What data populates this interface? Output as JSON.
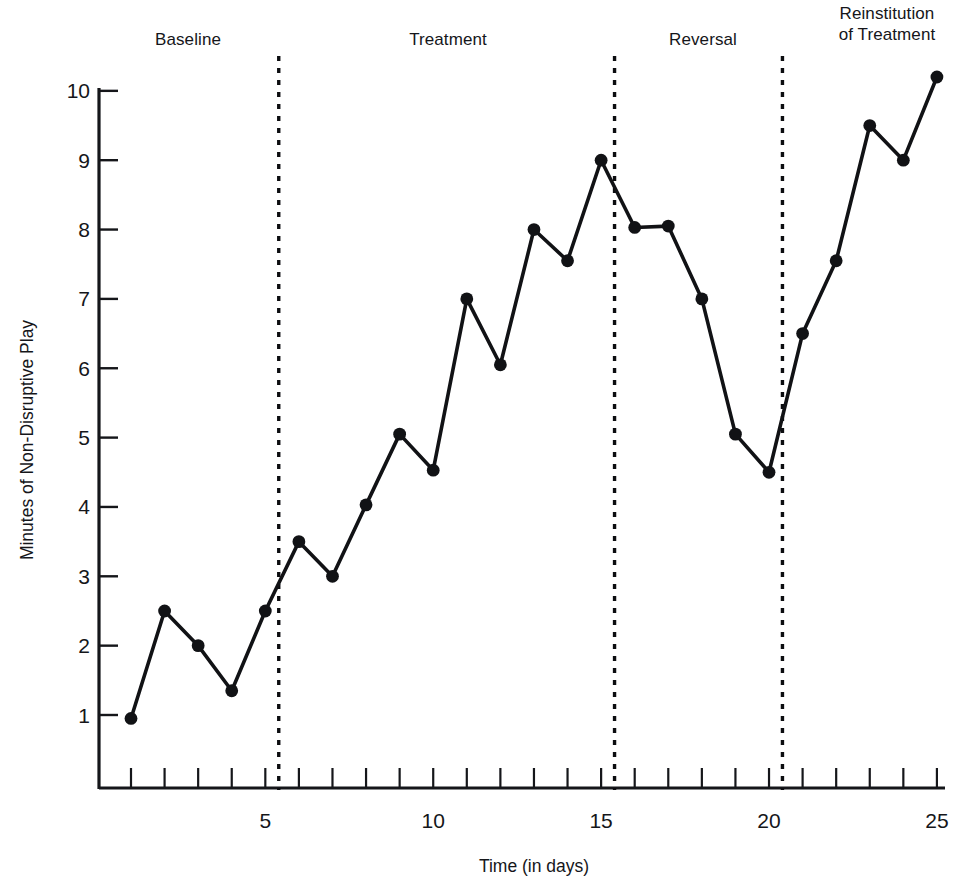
{
  "chart_data": {
    "type": "line",
    "title": "",
    "xlabel": "Time (in days)",
    "ylabel": "Minutes of Non-Disruptive Play",
    "xlim": [
      0,
      25.7
    ],
    "ylim": [
      0,
      10.6
    ],
    "grid": false,
    "legend": null,
    "x_tick_labels": [
      "5",
      "10",
      "15",
      "20",
      "25"
    ],
    "x_tick_values": [
      5,
      10,
      15,
      20,
      25
    ],
    "x_minor_ticks": [
      1,
      2,
      3,
      4,
      5,
      6,
      7,
      8,
      9,
      10,
      11,
      12,
      13,
      14,
      15,
      16,
      17,
      18,
      19,
      20,
      21,
      22,
      23,
      24,
      25
    ],
    "y_tick_labels": [
      "1",
      "2",
      "3",
      "4",
      "5",
      "6",
      "7",
      "8",
      "9",
      "10"
    ],
    "y_tick_values": [
      1,
      2,
      3,
      4,
      5,
      6,
      7,
      8,
      9,
      10
    ],
    "x": [
      1,
      2,
      3,
      4,
      5,
      6,
      7,
      8,
      9,
      10,
      11,
      12,
      13,
      14,
      15,
      16,
      17,
      18,
      19,
      20,
      21,
      22,
      23,
      24,
      25
    ],
    "values": [
      0.95,
      2.5,
      2.0,
      1.35,
      2.5,
      3.5,
      3.0,
      4.03,
      5.05,
      4.53,
      7.0,
      6.05,
      8.0,
      7.55,
      9.0,
      8.03,
      8.05,
      7.0,
      5.05,
      4.5,
      6.5,
      7.55,
      9.5,
      9.0,
      10.2
    ],
    "series": [
      {
        "name": "Minutes of Non-Disruptive Play",
        "values": [
          0.95,
          2.5,
          2.0,
          1.35,
          2.5,
          3.5,
          3.0,
          4.03,
          5.05,
          4.53,
          7.0,
          6.05,
          8.0,
          7.55,
          9.0,
          8.03,
          8.05,
          7.0,
          5.05,
          4.5,
          6.5,
          7.55,
          9.5,
          9.0,
          10.2
        ],
        "color": "#111215",
        "marker": "circle"
      }
    ],
    "phase_dividers": [
      5.4,
      15.4,
      20.4
    ],
    "annotations": [
      {
        "label": "Baseline",
        "phase_start": 1,
        "phase_end": 5.4
      },
      {
        "label": "Treatment",
        "phase_start": 5.4,
        "phase_end": 15.4
      },
      {
        "label": "Reversal",
        "phase_start": 15.4,
        "phase_end": 20.4
      },
      {
        "label": "Reinstitution\nof Treatment",
        "phase_start": 20.4,
        "phase_end": 25
      }
    ]
  },
  "axes": {
    "x_title": "Time (in days)",
    "y_title": "Minutes of Non-Disruptive Play"
  },
  "phases": [
    {
      "label": "Baseline"
    },
    {
      "label": "Treatment"
    },
    {
      "label": "Reversal"
    },
    {
      "label": "Reinstitution\nof Treatment"
    }
  ],
  "y_ticks": [
    {
      "label": "10"
    },
    {
      "label": "9"
    },
    {
      "label": "8"
    },
    {
      "label": "7"
    },
    {
      "label": "6"
    },
    {
      "label": "5"
    },
    {
      "label": "4"
    },
    {
      "label": "3"
    },
    {
      "label": "2"
    },
    {
      "label": "1"
    }
  ],
  "x_ticks": [
    {
      "label": "5"
    },
    {
      "label": "10"
    },
    {
      "label": "15"
    },
    {
      "label": "20"
    },
    {
      "label": "25"
    }
  ],
  "colors": {
    "ink": "#111215",
    "background": "#ffffff"
  }
}
